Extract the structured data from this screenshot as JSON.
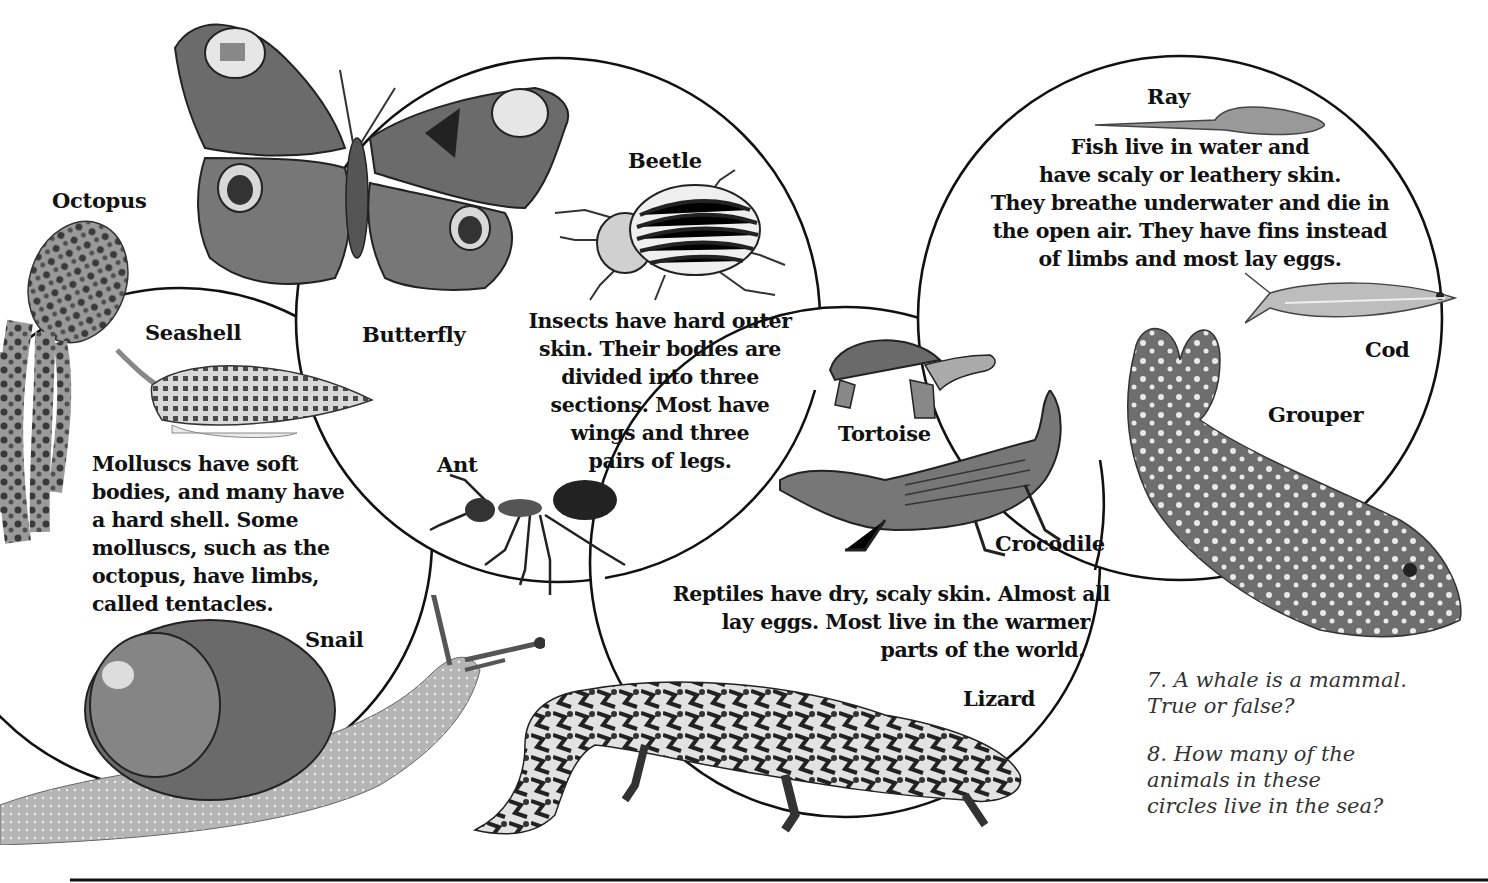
{
  "page": {
    "circles": [
      {
        "id": "molluscs",
        "description": "Molluscs have soft bodies, and many have a hard shell. Some molluscs, such as the octopus, have limbs, called tentacles.",
        "lines": [
          "Molluscs have soft",
          "bodies, and many have",
          "a hard shell. Some",
          "molluscs, such as the",
          "octopus, have limbs,",
          "called tentacles."
        ],
        "animals": [
          "Octopus",
          "Seashell",
          "Snail"
        ]
      },
      {
        "id": "insects",
        "description": "Insects have hard outer skin. Their bodies are divided into three sections. Most have wings and three pairs of legs.",
        "lines": [
          "Insects have hard outer",
          "skin. Their bodies are",
          "divided into three",
          "sections. Most have",
          "wings and three",
          "pairs of legs."
        ],
        "animals": [
          "Butterfly",
          "Beetle",
          "Ant"
        ]
      },
      {
        "id": "reptiles",
        "description": "Reptiles have dry, scaly skin. Almost all lay eggs. Most live in the warmer parts of the world.",
        "lines": [
          "Reptiles have dry, scaly skin. Almost all",
          "lay eggs. Most live in the warmer",
          "parts of the world."
        ],
        "animals": [
          "Tortoise",
          "Crocodile",
          "Lizard"
        ]
      },
      {
        "id": "fish",
        "description": "Fish live in water and have scaly or leathery skin. They breathe underwater and die in the open air. They have fins instead of limbs and most lay eggs.",
        "lines": [
          "Fish live in water and",
          "have scaly or leathery skin.",
          "They breathe underwater and die in",
          "the open air. They have fins instead",
          "of limbs and most lay eggs."
        ],
        "animals": [
          "Ray",
          "Cod",
          "Grouper"
        ]
      }
    ],
    "labels": {
      "octopus": "Octopus",
      "seashell": "Seashell",
      "snail": "Snail",
      "butterfly": "Butterfly",
      "beetle": "Beetle",
      "ant": "Ant",
      "tortoise": "Tortoise",
      "crocodile": "Crocodile",
      "lizard": "Lizard",
      "ray": "Ray",
      "cod": "Cod",
      "grouper": "Grouper"
    },
    "questions": [
      {
        "number": "7.",
        "lines": [
          "7. A whale is a mammal.",
          "True or false?"
        ]
      },
      {
        "number": "8.",
        "lines": [
          "8. How many of the",
          "animals in these",
          "circles live in the sea?"
        ]
      }
    ]
  }
}
